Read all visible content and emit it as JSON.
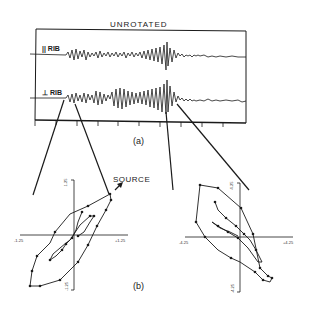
{
  "figure": {
    "panel_a": {
      "title": "UNROTATED",
      "traces": [
        {
          "label": "|| RIB"
        },
        {
          "label": "⊥ RIB"
        }
      ],
      "caption": "(a)"
    },
    "panel_b": {
      "caption": "(b)",
      "annotation": "SOURCE",
      "left_plot": {
        "x_ticks": [
          "-1.25",
          "+1.25"
        ],
        "y_ticks": [
          "1.25",
          "-1.25"
        ]
      },
      "right_plot": {
        "x_ticks": [
          "-4.25",
          "+4.25"
        ],
        "y_ticks": [
          "4.25",
          "-4.25"
        ]
      }
    }
  }
}
